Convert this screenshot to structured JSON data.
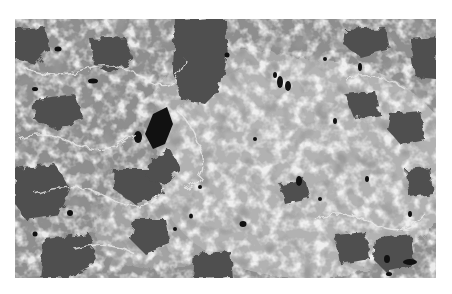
{
  "image": {
    "description": "Grayscale micrograph texture with dark gray domains, mid-gray matrix, light gray/white speckled network and small black pores",
    "colors": {
      "background": "#ffffff",
      "matrix": "#8e8e8e",
      "dark_domain": "#4f4f4f",
      "light_phase": "#c4c4c4",
      "highlight": "#ececec",
      "pore": "#111111"
    }
  }
}
